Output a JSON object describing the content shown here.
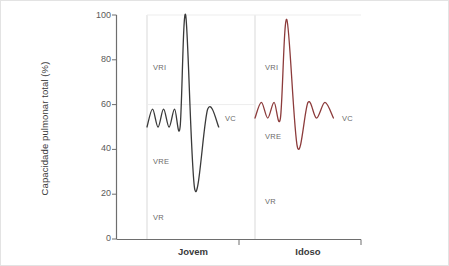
{
  "chart_data": {
    "type": "line",
    "title": "",
    "xlabel": "",
    "ylabel": "Capacidade pulmonar total (%)",
    "ylim": [
      0,
      100
    ],
    "yticks": [
      0,
      20,
      40,
      60,
      80,
      100
    ],
    "ytick_labels": [
      "0",
      "20",
      "40",
      "60",
      "80",
      "100"
    ],
    "grid": false,
    "legend_position": "none",
    "categories": [
      "Jovem",
      "Idoso"
    ],
    "series": [
      {
        "name": "Jovem",
        "color": "#3a3a3a",
        "panel": 0,
        "description": "Espirograma de adulto jovem: volume corrente entre 50% e 58%, inspiracao maxima a 100%, expiracao forcada ate 22% (volume residual).",
        "baseline_min": 50,
        "baseline_max": 58,
        "peak": 100,
        "trough": 22,
        "points": [
          [
            0.0,
            50
          ],
          [
            0.06,
            58
          ],
          [
            0.12,
            50
          ],
          [
            0.18,
            58
          ],
          [
            0.24,
            50
          ],
          [
            0.3,
            58
          ],
          [
            0.36,
            50
          ],
          [
            0.42,
            100
          ],
          [
            0.52,
            22
          ],
          [
            0.66,
            58
          ],
          [
            0.78,
            50
          ]
        ]
      },
      {
        "name": "Idoso",
        "color": "#8c3b3b",
        "panel": 1,
        "description": "Espirograma de idoso: volume corrente entre 54% e 61%, inspiracao maxima a 98%, expiracao forcada ate 41% (volume residual aumentado).",
        "baseline_min": 54,
        "baseline_max": 61,
        "peak": 98,
        "trough": 41,
        "points": [
          [
            0.0,
            54
          ],
          [
            0.06,
            61
          ],
          [
            0.12,
            54
          ],
          [
            0.18,
            61
          ],
          [
            0.24,
            54
          ],
          [
            0.3,
            98
          ],
          [
            0.4,
            41
          ],
          [
            0.5,
            61
          ],
          [
            0.58,
            54
          ],
          [
            0.66,
            61
          ],
          [
            0.74,
            54
          ]
        ]
      }
    ],
    "annotations": [
      {
        "text": "VRI",
        "meaning": "Volume de Reserva Inspiratorio",
        "panel": 0,
        "x_px": 152,
        "y_px": 62
      },
      {
        "text": "VRE",
        "meaning": "Volume de Reserva Expiratorio",
        "panel": 0,
        "x_px": 152,
        "y_px": 156
      },
      {
        "text": "VR",
        "meaning": "Volume Residual",
        "panel": 0,
        "x_px": 152,
        "y_px": 212
      },
      {
        "text": "VC",
        "meaning": "Volume Corrente",
        "panel": 0,
        "x_px": 224,
        "y_px": 113
      },
      {
        "text": "VRI",
        "meaning": "Volume de Reserva Inspiratorio",
        "panel": 1,
        "x_px": 264,
        "y_px": 62
      },
      {
        "text": "VRE",
        "meaning": "Volume de Reserva Expiratorio",
        "panel": 1,
        "x_px": 264,
        "y_px": 131
      },
      {
        "text": "VR",
        "meaning": "Volume Residual",
        "panel": 1,
        "x_px": 264,
        "y_px": 196
      },
      {
        "text": "VC",
        "meaning": "Volume Corrente",
        "panel": 1,
        "x_px": 341,
        "y_px": 113
      }
    ],
    "colors": {
      "axis": "#6e6e6e",
      "text": "#4a4a4a",
      "annotation": "#6b6b6b",
      "guide": "#d9d9d9",
      "frame": "#e3e3e3",
      "background": "#ffffff",
      "jovem": "#3a3a3a",
      "idoso": "#8c3b3b"
    }
  }
}
